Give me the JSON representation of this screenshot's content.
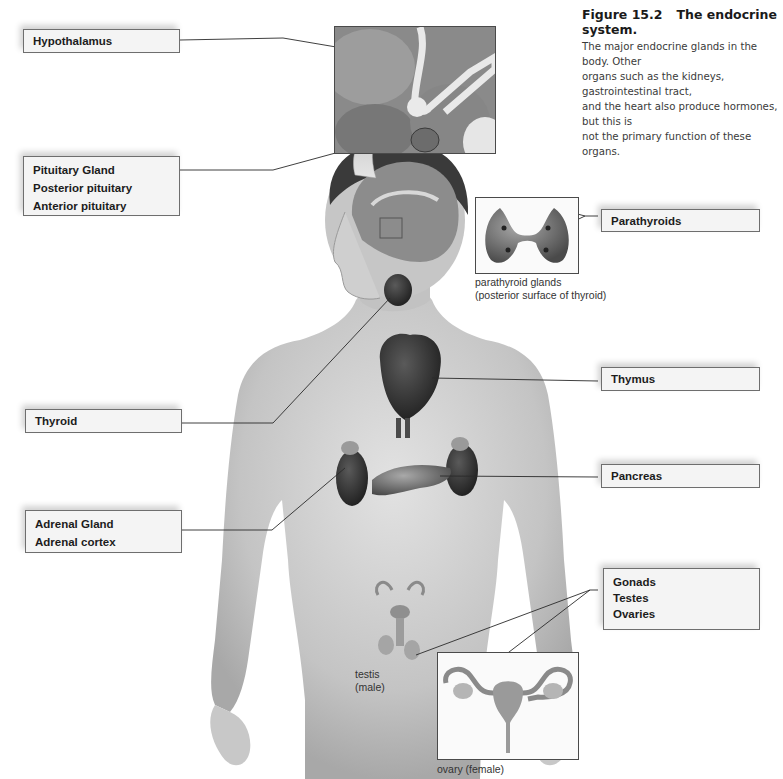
{
  "figure": {
    "number": "Figure 15.2",
    "title": "The endocrine system.",
    "description": "The major endocrine glands in the body. Other organs such as the kidneys, gastrointestinal tract, and the heart also produce hormones, but this is not the primary function of these organs.",
    "description_lines": [
      "The major endocrine glands in the body. Other",
      "organs such as the kidneys, gastrointestinal tract,",
      "and the heart also produce hormones, but this is",
      "not the primary function of these organs."
    ]
  },
  "labels": {
    "hypothalamus": [
      "Hypothalamus"
    ],
    "pituitary": [
      "Pituitary Gland",
      "Posterior pituitary",
      "Anterior pituitary"
    ],
    "thyroid": [
      "Thyroid"
    ],
    "adrenal": [
      "Adrenal Gland",
      "Adrenal cortex"
    ],
    "parathyroids": [
      "Parathyroids"
    ],
    "thymus": [
      "Thymus"
    ],
    "pancreas": [
      "Pancreas"
    ],
    "gonads": [
      "Gonads",
      "Testes",
      "Ovaries"
    ]
  },
  "sub_captions": {
    "parathyroid": [
      "parathyroid glands",
      "(posterior surface of thyroid)"
    ],
    "testis": [
      "testis",
      "(male)"
    ],
    "ovary": [
      "ovary (female)"
    ]
  },
  "colors": {
    "label_bg": "#f4f4f4",
    "label_border": "#6e6e6e",
    "leader_line": "#2a2a2a",
    "skin": "#c9c9c9",
    "organ": "#8a8a8a"
  }
}
